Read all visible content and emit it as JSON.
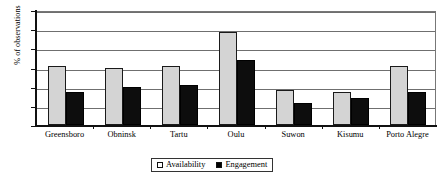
{
  "chart_data": {
    "type": "bar",
    "title": "",
    "xlabel": "",
    "ylabel": "% of observations",
    "ylim": [
      0,
      30
    ],
    "ytick_labels": [
      "0",
      "5",
      "10",
      "15",
      "20",
      "25",
      "30"
    ],
    "yticks": [
      0,
      5,
      10,
      15,
      20,
      25,
      30
    ],
    "grid": true,
    "legend_position": "bottom-center",
    "categories": [
      "Greensboro",
      "Obninsk",
      "Tartu",
      "Oulu",
      "Suwon",
      "Kisumu",
      "Porto Alegre"
    ],
    "series": [
      {
        "name": "Availability",
        "color": "#d4d4d4",
        "values": [
          15.5,
          14.8,
          15.5,
          24.3,
          9.2,
          8.5,
          15.4
        ]
      },
      {
        "name": "Engagement",
        "color": "#0d0d0d",
        "values": [
          8.6,
          9.8,
          10.5,
          17.0,
          5.8,
          7.0,
          8.5
        ]
      }
    ]
  },
  "legend": {
    "items": [
      {
        "label": "Availability",
        "swatch": "legend-swatch-availability"
      },
      {
        "label": "Engagement",
        "swatch": "legend-swatch-engagement"
      }
    ]
  }
}
